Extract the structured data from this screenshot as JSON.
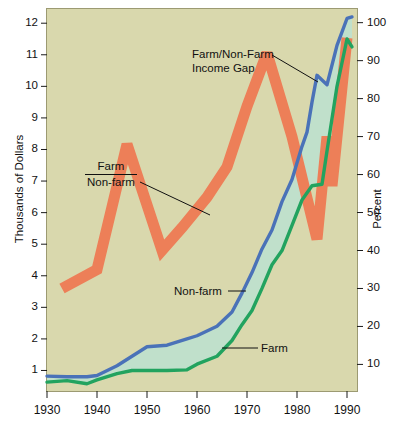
{
  "chart_data": {
    "type": "line",
    "title": "",
    "xlabel": "",
    "ylabel": "Thousands of Dollars",
    "y2label": "Percent",
    "xlim": [
      1930,
      1992
    ],
    "ylim": [
      0.35,
      12.45
    ],
    "y2lim": [
      3.0,
      103.6
    ],
    "grid": false,
    "legend": "none",
    "xticks": [
      1930,
      1940,
      1950,
      1960,
      1970,
      1980,
      1990
    ],
    "xticklabels": [
      "1930",
      "1940",
      "1950",
      "1960",
      "1970",
      "1980",
      "1990"
    ],
    "yticks": [
      1,
      2,
      3,
      4,
      5,
      6,
      7,
      8,
      9,
      10,
      11,
      12
    ],
    "yticklabels": [
      "1",
      "2",
      "3",
      "4",
      "5",
      "6",
      "7",
      "8",
      "9",
      "10",
      "11",
      "12"
    ],
    "y2ticks": [
      10,
      20,
      30,
      40,
      50,
      60,
      70,
      80,
      90,
      100
    ],
    "y2ticklabels": [
      "10",
      "20",
      "30",
      "40",
      "50",
      "60",
      "70",
      "80",
      "90",
      "100"
    ],
    "series": [
      {
        "name": "Non-farm",
        "color": "#4a72b8",
        "axis": "left",
        "x": [
          1930,
          1934,
          1938,
          1940,
          1944,
          1947,
          1950,
          1954,
          1958,
          1960,
          1964,
          1967,
          1969,
          1971,
          1973,
          1975,
          1977,
          1979,
          1981,
          1982,
          1983,
          1984,
          1986,
          1988,
          1990,
          1991
        ],
        "values": [
          0.82,
          0.8,
          0.8,
          0.84,
          1.15,
          1.45,
          1.75,
          1.8,
          2.0,
          2.1,
          2.4,
          2.85,
          3.45,
          4.1,
          4.85,
          5.45,
          6.35,
          7.05,
          8.1,
          8.55,
          9.5,
          10.35,
          10.05,
          11.3,
          12.15,
          12.2
        ]
      },
      {
        "name": "Farm",
        "color": "#22a35f",
        "axis": "left",
        "x": [
          1930,
          1934,
          1938,
          1940,
          1944,
          1947,
          1950,
          1954,
          1958,
          1960,
          1964,
          1967,
          1969,
          1971,
          1973,
          1975,
          1977,
          1979,
          1981,
          1983,
          1985,
          1986,
          1988,
          1990,
          1991
        ],
        "values": [
          0.63,
          0.68,
          0.58,
          0.7,
          0.9,
          1.0,
          1.0,
          1.0,
          1.02,
          1.2,
          1.45,
          1.95,
          2.45,
          2.9,
          3.6,
          4.35,
          4.8,
          5.6,
          6.4,
          6.85,
          6.9,
          7.95,
          10.0,
          11.5,
          11.25
        ]
      },
      {
        "name": "Farm/Non-farm",
        "color": "#ed7f58",
        "axis": "right",
        "x": [
          1933,
          1940,
          1946,
          1953,
          1957,
          1962,
          1966,
          1970,
          1974,
          1979,
          1984,
          1986,
          1987,
          1990
        ],
        "values": [
          30,
          35,
          68,
          40,
          46,
          54,
          62,
          78,
          92,
          70,
          43,
          70,
          57,
          96
        ]
      }
    ],
    "fill_between": {
      "label": "Farm/Non-Farm Income Gap",
      "between": [
        "Non-farm",
        "Farm"
      ],
      "color": "#bfe0cc"
    },
    "annotations": [
      {
        "id": "income-gap",
        "text_line1": "Farm/Non-Farm",
        "text_line2": "Income Gap",
        "target": "fill-between-area"
      },
      {
        "id": "ratio",
        "numerator": "Farm",
        "denominator": "Non-farm",
        "target": "orange-ratio-band"
      },
      {
        "id": "nonfarm",
        "text": "Non-farm",
        "target": "blue-line"
      },
      {
        "id": "farm",
        "text": "Farm",
        "target": "green-line"
      }
    ]
  },
  "axes": {
    "left_title": "Thousands of Dollars",
    "right_title": "Percent"
  },
  "colors": {
    "background": "#d9d8ad",
    "nonfarm": "#4a72b8",
    "farm": "#22a35f",
    "ratio": "#ed7f58",
    "gap_fill": "#bfe0cc",
    "axis": "#1a1a1a"
  }
}
